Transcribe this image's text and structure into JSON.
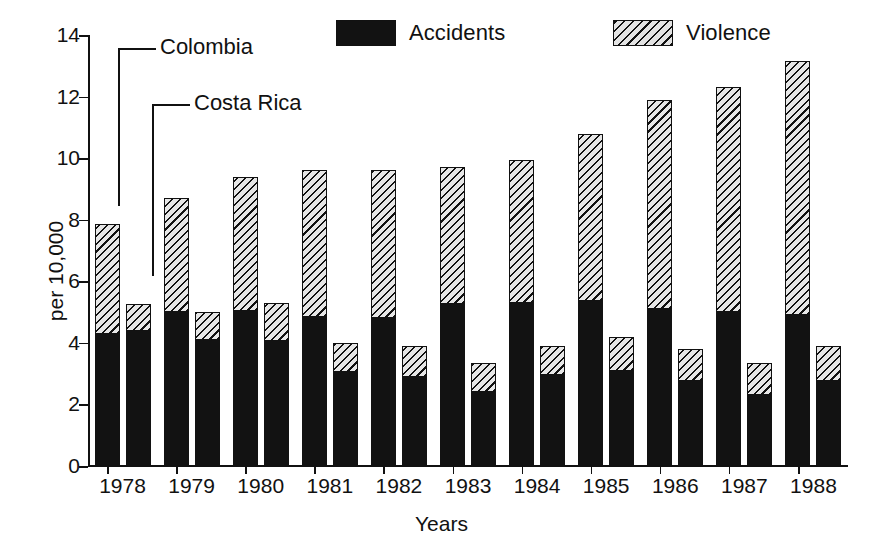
{
  "chart_data": {
    "type": "bar",
    "subtype": "grouped-stacked",
    "title": "",
    "xlabel": "Years",
    "ylabel": "per 10,000",
    "ylim": [
      0,
      14
    ],
    "ytick_values": [
      0,
      2,
      4,
      6,
      8,
      10,
      12,
      14
    ],
    "ytick_labels": [
      "0",
      "2",
      "4",
      "6",
      "8",
      "10",
      "12",
      "14"
    ],
    "categories": [
      "1978",
      "1979",
      "1980",
      "1981",
      "1982",
      "1983",
      "1984",
      "1985",
      "1986",
      "1987",
      "1988"
    ],
    "grid": false,
    "legend_position": "top",
    "legend": [
      {
        "label": "Accidents",
        "pattern": "solid-black",
        "color": "#121212"
      },
      {
        "label": "Violence",
        "pattern": "diagonal-hatch",
        "color": "#e6e6e6"
      }
    ],
    "groups": [
      {
        "name": "Colombia",
        "annotation": "Colombia",
        "series": [
          {
            "name": "Accidents",
            "values": [
              4.3,
              5.0,
              5.05,
              4.85,
              4.8,
              5.25,
              5.3,
              5.35,
              5.1,
              5.0,
              4.9
            ]
          },
          {
            "name": "Violence",
            "values": [
              3.55,
              3.7,
              4.35,
              4.75,
              4.8,
              4.45,
              4.65,
              5.45,
              6.8,
              7.3,
              8.25
            ]
          }
        ],
        "totals": [
          7.85,
          8.7,
          9.4,
          9.6,
          9.6,
          9.7,
          9.95,
          10.8,
          11.9,
          12.3,
          13.15
        ]
      },
      {
        "name": "Costa Rica",
        "annotation": "Costa Rica",
        "series": [
          {
            "name": "Accidents",
            "values": [
              4.4,
              4.1,
              4.05,
              3.05,
              2.9,
              2.4,
              2.95,
              3.1,
              2.75,
              2.3,
              2.75
            ]
          },
          {
            "name": "Violence",
            "values": [
              0.85,
              0.9,
              1.25,
              0.95,
              1.0,
              0.95,
              0.95,
              1.1,
              1.05,
              1.05,
              1.15
            ]
          }
        ],
        "totals": [
          5.25,
          5.0,
          5.3,
          4.0,
          3.9,
          3.35,
          3.9,
          4.2,
          3.8,
          3.35,
          3.9
        ]
      }
    ]
  },
  "annotations": {
    "colombia": "Colombia",
    "costa_rica": "Costa Rica"
  },
  "legend": {
    "accidents_label": "Accidents",
    "violence_label": "Violence"
  },
  "axes": {
    "y_title": "per 10,000",
    "x_title": "Years"
  }
}
